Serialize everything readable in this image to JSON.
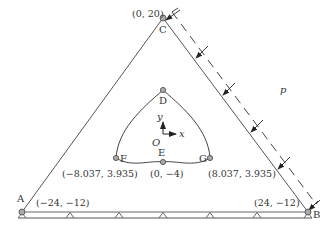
{
  "figure": {
    "points": {
      "C": {
        "label": "C",
        "coord": "(0, 20)"
      },
      "A": {
        "label": "A",
        "coord": "(−24, −12)"
      },
      "B": {
        "label": "B",
        "coord": "(24, −12)"
      },
      "D": {
        "label": "D"
      },
      "E": {
        "label": "E",
        "coord": "(0, −4)"
      },
      "F": {
        "label": "F",
        "coord": "(−8.037, 3.935)"
      },
      "G": {
        "label": "G",
        "coord": "(8.037, 3.935)"
      }
    },
    "axes": {
      "origin": "O",
      "x": "x",
      "y": "y"
    },
    "load": {
      "label": "p"
    },
    "colors": {
      "line": "#555555",
      "node_fill": "#aaaaaa",
      "text": "#333333"
    }
  }
}
